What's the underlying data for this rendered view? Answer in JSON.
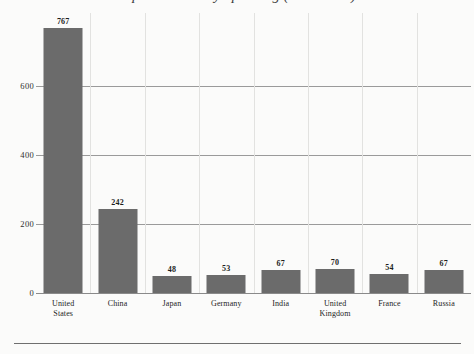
{
  "chart_data": {
    "type": "bar",
    "title": "Top Countries by Spending (in Billions)",
    "xlabel": "",
    "ylabel": "",
    "categories": [
      "United States",
      "China",
      "Japan",
      "Germany",
      "India",
      "United Kingdom",
      "France",
      "Russia"
    ],
    "category_lines": [
      [
        "United",
        "States"
      ],
      [
        "China"
      ],
      [
        "Japan"
      ],
      [
        "Germany"
      ],
      [
        "India"
      ],
      [
        "United",
        "Kingdom"
      ],
      [
        "France"
      ],
      [
        "Russia"
      ]
    ],
    "values": [
      767,
      242,
      48,
      53,
      67,
      70,
      54,
      67
    ],
    "value_labels": [
      "767",
      "242",
      "48",
      "53",
      "67",
      "70",
      "54",
      "67"
    ],
    "yticks": [
      0,
      200,
      400,
      600
    ],
    "ytick_labels": [
      "0",
      "200",
      "400",
      "600"
    ],
    "ylim": [
      0,
      810
    ],
    "grid": "horizontal-and-vertical",
    "legend": "none",
    "bar_color": "#6b6b6b",
    "background_color": "#fbfbfa",
    "gridline_color": "#9a9a9a",
    "separator_color": "#e2e2e0",
    "text_color": "#1d1d1d"
  }
}
